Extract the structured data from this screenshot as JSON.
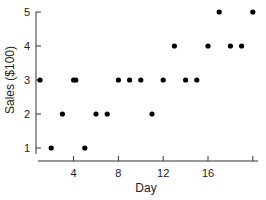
{
  "chart_data": {
    "type": "scatter",
    "title": "",
    "xlabel": "Day",
    "ylabel": "Sales ($100)",
    "x": [
      1,
      2,
      3,
      4,
      4.2,
      5,
      6,
      7,
      8,
      9,
      10,
      11,
      12,
      13,
      14,
      15,
      16,
      17,
      18,
      19,
      20
    ],
    "y": [
      3,
      1,
      2,
      3,
      3,
      1,
      2,
      2,
      3,
      3,
      3,
      2,
      3,
      4,
      3,
      3,
      4,
      5,
      4,
      4,
      5
    ],
    "xticks": [
      4,
      8,
      12,
      16,
      20
    ],
    "xtick_labels": [
      "4",
      "8",
      "12",
      "16",
      ""
    ],
    "yticks": [
      1,
      2,
      3,
      4,
      5
    ],
    "ytick_labels": [
      "1",
      "2",
      "3",
      "4",
      "5"
    ],
    "xlim": [
      1,
      20
    ],
    "ylim": [
      1,
      5
    ],
    "grid": false,
    "legend": null,
    "marker_color": "#000000"
  }
}
